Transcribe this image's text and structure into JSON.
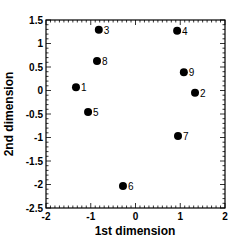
{
  "chart_data": {
    "type": "scatter",
    "title": "",
    "xlabel": "1st dimension",
    "ylabel": "2nd dimension",
    "xlim": [
      -2,
      2
    ],
    "ylim": [
      -2.5,
      1.5
    ],
    "xticks": [
      -2,
      -1,
      0,
      1,
      2
    ],
    "yticks": [
      1.5,
      1,
      0.5,
      0,
      -0.5,
      -1,
      -1.5,
      -2,
      -2.5
    ],
    "xtick_labels": [
      "-2",
      "-1",
      "0",
      "1",
      "2"
    ],
    "ytick_labels": [
      "1.5",
      "1",
      "0.5",
      "0",
      "-0.5",
      "-1",
      "-1.5",
      "-2",
      "-2.5"
    ],
    "grid": false,
    "legend": null,
    "points": [
      {
        "label": "1",
        "x": -1.33,
        "y": 0.07
      },
      {
        "label": "2",
        "x": 1.33,
        "y": -0.05
      },
      {
        "label": "3",
        "x": -0.82,
        "y": 1.29
      },
      {
        "label": "4",
        "x": 0.93,
        "y": 1.27
      },
      {
        "label": "5",
        "x": -1.06,
        "y": -0.46
      },
      {
        "label": "6",
        "x": -0.28,
        "y": -2.03
      },
      {
        "label": "7",
        "x": 0.95,
        "y": -0.97
      },
      {
        "label": "8",
        "x": -0.86,
        "y": 0.63
      },
      {
        "label": "9",
        "x": 1.08,
        "y": 0.39
      }
    ],
    "marker_color": "#000000"
  }
}
